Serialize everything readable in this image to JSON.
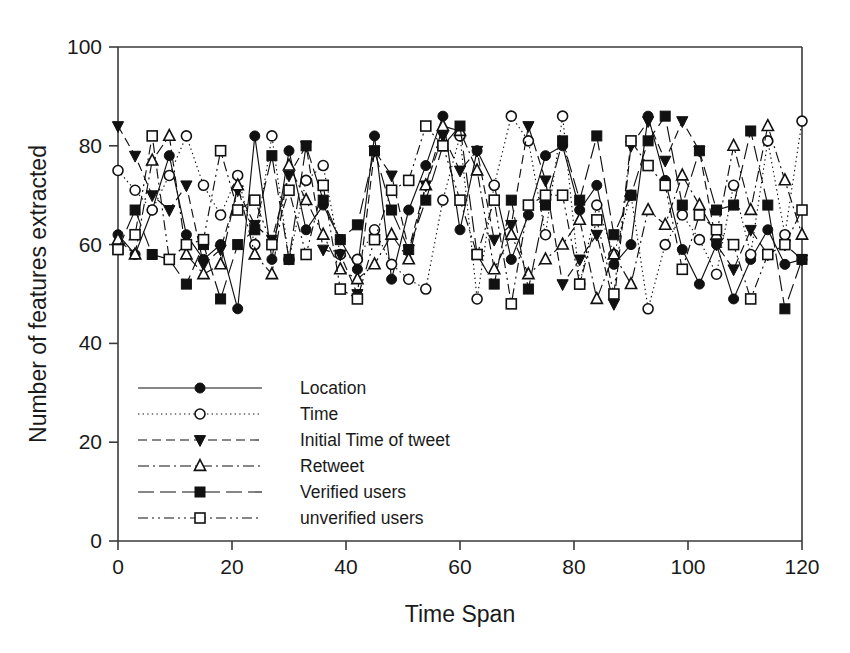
{
  "chart_data": {
    "type": "line",
    "title": "",
    "xlabel": "Time Span",
    "ylabel": "Number of features extracted",
    "xlim": [
      0,
      120
    ],
    "ylim": [
      0,
      100
    ],
    "xticks": [
      0,
      20,
      40,
      60,
      80,
      100,
      120
    ],
    "yticks": [
      0,
      20,
      40,
      60,
      80,
      100
    ],
    "grid": false,
    "legend_position": "inside-lower-left",
    "axis_color": "#3a3a3a",
    "line_color": "#111111",
    "x": [
      0,
      3,
      6,
      9,
      12,
      15,
      18,
      21,
      24,
      27,
      30,
      33,
      36,
      39,
      42,
      45,
      48,
      51,
      54,
      57,
      60,
      63,
      66,
      69,
      72,
      75,
      78,
      81,
      84,
      87,
      90,
      93,
      96,
      99,
      102,
      105,
      108,
      111,
      114,
      117,
      120
    ],
    "series": [
      {
        "name": "Location",
        "marker": "filled-circle",
        "linestyle": "solid",
        "values": [
          62,
          58,
          67,
          78,
          62,
          57,
          60,
          47,
          82,
          57,
          79,
          63,
          68,
          61,
          55,
          82,
          53,
          67,
          76,
          86,
          63,
          79,
          72,
          57,
          66,
          78,
          80,
          67,
          72,
          56,
          60,
          86,
          73,
          59,
          52,
          60,
          49,
          57,
          63,
          56,
          57
        ]
      },
      {
        "name": "Time",
        "marker": "open-circle",
        "linestyle": "dotted",
        "values": [
          75,
          71,
          67,
          74,
          82,
          72,
          66,
          74,
          60,
          82,
          57,
          73,
          76,
          58,
          57,
          63,
          56,
          53,
          51,
          69,
          82,
          49,
          72,
          86,
          81,
          62,
          86,
          52,
          68,
          58,
          70,
          47,
          60,
          66,
          61,
          54,
          72,
          58,
          81,
          62,
          85
        ]
      },
      {
        "name": "Initial Time of tweet",
        "marker": "filled-triangle-down",
        "linestyle": "dashed",
        "values": [
          84,
          78,
          70,
          67,
          72,
          56,
          59,
          71,
          64,
          61,
          74,
          80,
          59,
          58,
          50,
          79,
          74,
          59,
          72,
          82,
          75,
          79,
          61,
          64,
          84,
          73,
          52,
          57,
          62,
          48,
          80,
          85,
          77,
          85,
          79,
          60,
          55,
          63,
          58,
          60,
          57
        ]
      },
      {
        "name": "Retweet",
        "marker": "open-triangle-up",
        "linestyle": "dash-dot",
        "values": [
          61,
          58,
          77,
          82,
          58,
          54,
          56,
          72,
          58,
          54,
          76,
          69,
          62,
          55,
          53,
          56,
          62,
          57,
          72,
          84,
          83,
          75,
          55,
          62,
          54,
          57,
          60,
          65,
          49,
          58,
          52,
          67,
          64,
          74,
          68,
          62,
          80,
          67,
          84,
          73,
          62
        ]
      },
      {
        "name": "Verified users",
        "marker": "filled-square",
        "linestyle": "long-dash",
        "values": [
          59,
          67,
          58,
          57,
          52,
          60,
          49,
          60,
          63,
          78,
          57,
          80,
          69,
          61,
          64,
          79,
          67,
          59,
          69,
          80,
          84,
          58,
          52,
          69,
          51,
          68,
          81,
          69,
          82,
          62,
          70,
          81,
          86,
          68,
          79,
          67,
          68,
          83,
          68,
          47,
          57
        ]
      },
      {
        "name": "unverified users",
        "marker": "open-square",
        "linestyle": "dash-dot-dot",
        "values": [
          59,
          62,
          82,
          57,
          60,
          61,
          79,
          67,
          69,
          60,
          71,
          58,
          72,
          51,
          49,
          61,
          71,
          73,
          84,
          80,
          69,
          58,
          69,
          48,
          68,
          70,
          70,
          52,
          65,
          50,
          81,
          76,
          72,
          55,
          66,
          63,
          60,
          49,
          58,
          60,
          67
        ]
      }
    ]
  }
}
